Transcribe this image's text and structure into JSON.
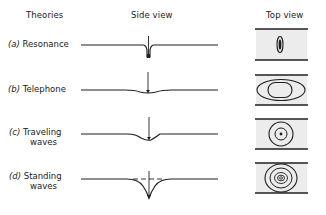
{
  "headers": {
    "theories": "Theories",
    "side_view": "Side view",
    "top_view": "Top view"
  },
  "rows": [
    {
      "tag": "(a)",
      "name": "Resonance",
      "name2": ""
    },
    {
      "tag": "(b)",
      "name": "Telephone",
      "name2": ""
    },
    {
      "tag": "(c)",
      "name": "Traveling",
      "name2": "waves"
    },
    {
      "tag": "(d)",
      "name": "Standing",
      "name2": "waves"
    }
  ],
  "colors": {
    "line": "#1f1f1f",
    "panel_fill": "#ececec"
  }
}
